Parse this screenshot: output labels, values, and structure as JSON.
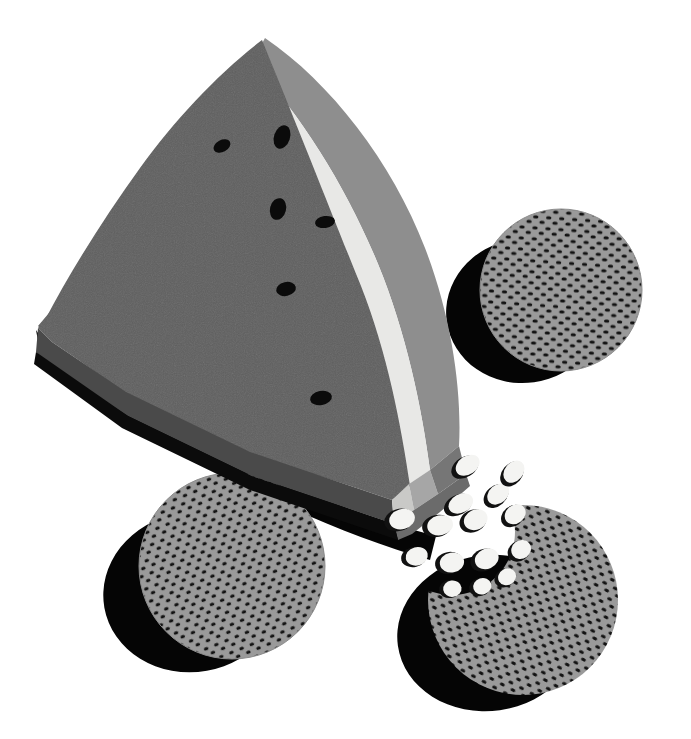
{
  "artwork": {
    "title": "Watermelon wedge with two whole melon-seed rounds and one bitten round",
    "subject": "watermelon",
    "style": "flat vector illustration, grayscale",
    "width": 691,
    "height": 739,
    "background_color": "#ffffff"
  },
  "palette": {
    "background": "#ffffff",
    "flesh_top": "#5f5f5f",
    "flesh_side": "#4a4a4a",
    "rind_white": "#e8e8e6",
    "rind_white_side": "#c9c9c7",
    "rind_outer": "#8e8e8e",
    "rind_outer_side": "#767676",
    "rind_outer_side_dark": "#6b6b6b",
    "seed_black": "#0b0b0b",
    "shadow_black": "#050505",
    "round_base": "#9a9a9a",
    "round_speckle": "#111111",
    "melon_seed_body": "#f4f4f2",
    "melon_seed_rim": "#111111"
  },
  "objects": {
    "wedge": {
      "name": "watermelon-wedge",
      "layers": [
        {
          "label": "flesh",
          "color": "#5f5f5f"
        },
        {
          "label": "flesh-side",
          "color": "#4a4a4a"
        },
        {
          "label": "white-rind",
          "color": "#e8e8e6"
        },
        {
          "label": "outer-rind",
          "color": "#8e8e8e"
        }
      ],
      "seed_count": 5,
      "seeds": [
        {
          "cx": 222,
          "cy": 146,
          "rx": 9,
          "ry": 6,
          "rot": -28
        },
        {
          "cx": 282,
          "cy": 137,
          "rx": 8,
          "ry": 12,
          "rot": 18
        },
        {
          "cx": 278,
          "cy": 209,
          "rx": 8,
          "ry": 11,
          "rot": 14
        },
        {
          "cx": 323,
          "cy": 222,
          "rx": 10,
          "ry": 6,
          "rot": -8
        },
        {
          "cx": 285,
          "cy": 288,
          "rx": 10,
          "ry": 7,
          "rot": -12
        },
        {
          "cx": 320,
          "cy": 398,
          "rx": 11,
          "ry": 7,
          "rot": -10
        }
      ]
    },
    "rounds": [
      {
        "name": "melon-round-top-right",
        "cx": 561,
        "cy": 290,
        "r": 81,
        "bitten": false,
        "shadow": {
          "cx": 524,
          "cy": 311,
          "rx": 78,
          "ry": 72,
          "rot": -8
        }
      },
      {
        "name": "melon-round-bottom-left",
        "cx": 232,
        "cy": 566,
        "r": 93,
        "bitten": false,
        "shadow": {
          "cx": 193,
          "cy": 592,
          "rx": 90,
          "ry": 80,
          "rot": -10
        }
      },
      {
        "name": "melon-round-bitten-bottom-right",
        "cx": 523,
        "cy": 600,
        "r": 95,
        "bitten": true,
        "bite": {
          "cx": 453,
          "cy": 533,
          "r": 62
        },
        "shadow": {
          "cx": 489,
          "cy": 631,
          "rx": 90,
          "ry": 76,
          "rot": -8
        }
      }
    ],
    "scattered_seeds": {
      "name": "scattered-melon-seeds",
      "count": 15,
      "items": [
        {
          "cx": 465,
          "cy": 467,
          "rx": 15,
          "ry": 10,
          "rot": -34
        },
        {
          "cx": 458,
          "cy": 505,
          "rx": 15,
          "ry": 10,
          "rot": -28
        },
        {
          "cx": 494,
          "cy": 496,
          "rx": 14,
          "ry": 10,
          "rot": -40
        },
        {
          "cx": 510,
          "cy": 474,
          "rx": 14,
          "ry": 10,
          "rot": -48
        },
        {
          "cx": 399,
          "cy": 520,
          "rx": 15,
          "ry": 11,
          "rot": -18
        },
        {
          "cx": 436,
          "cy": 525,
          "rx": 15,
          "ry": 11,
          "rot": -14
        },
        {
          "cx": 472,
          "cy": 521,
          "rx": 14,
          "ry": 11,
          "rot": -26
        },
        {
          "cx": 512,
          "cy": 517,
          "rx": 13,
          "ry": 10,
          "rot": -36
        },
        {
          "cx": 415,
          "cy": 556,
          "rx": 13,
          "ry": 10,
          "rot": -16
        },
        {
          "cx": 448,
          "cy": 562,
          "rx": 14,
          "ry": 11,
          "rot": -12
        },
        {
          "cx": 483,
          "cy": 560,
          "rx": 14,
          "ry": 11,
          "rot": -24
        },
        {
          "cx": 518,
          "cy": 552,
          "rx": 12,
          "ry": 10,
          "rot": -34
        },
        {
          "cx": 449,
          "cy": 588,
          "rx": 11,
          "ry": 9,
          "rot": -10
        },
        {
          "cx": 479,
          "cy": 586,
          "rx": 11,
          "ry": 9,
          "rot": -18
        },
        {
          "cx": 504,
          "cy": 578,
          "rx": 11,
          "ry": 9,
          "rot": -28
        }
      ]
    }
  }
}
